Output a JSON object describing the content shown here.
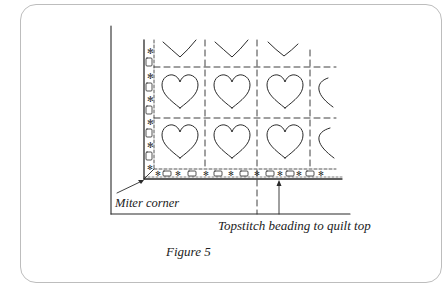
{
  "figure": {
    "caption": "Figure 5",
    "labels": {
      "miter_corner": "Miter corner",
      "topstitch": "Topstitch beading to quilt top"
    },
    "motif": "heart",
    "grid": {
      "columns": 4,
      "rows": 2,
      "top_partial_row": "heart bottoms (V shapes)",
      "right_partial_column": "half hearts"
    },
    "border_beading": {
      "pattern": [
        "star-bead",
        "rectangle-bead"
      ],
      "sides": [
        "left",
        "bottom"
      ]
    },
    "colors": {
      "line": "#2a2a2a",
      "card_border": "#bdbdbd",
      "background": "#ffffff"
    }
  }
}
